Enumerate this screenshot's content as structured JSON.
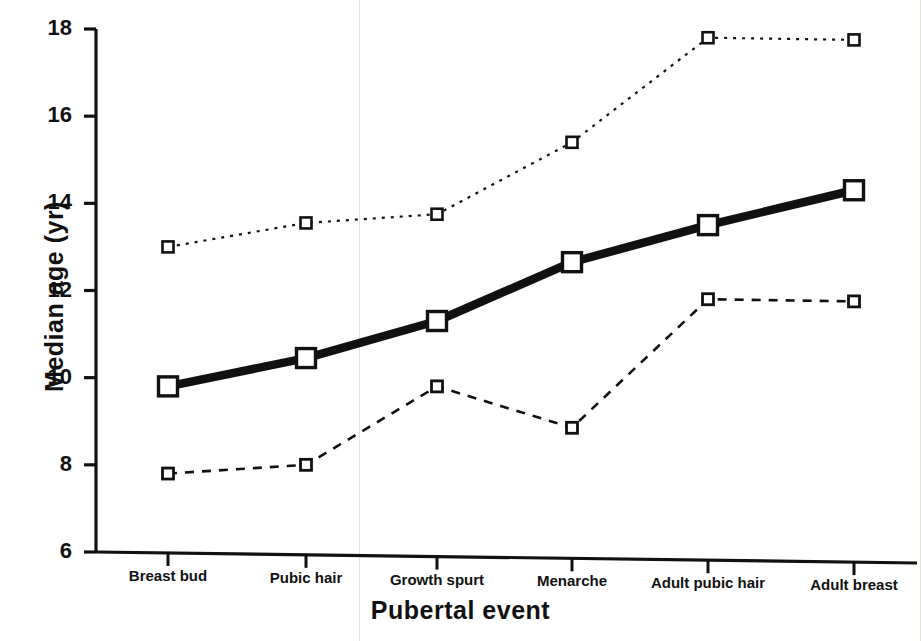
{
  "figure": {
    "background": "#ffffff",
    "ink_color": "#111111",
    "scan_artifact_color": "#dfe2dd"
  },
  "axes": {
    "y_title": "Median age (yr)",
    "x_title": "Pubertal event",
    "y_ticks": [
      "18",
      "16",
      "14",
      "12",
      "10",
      "8",
      "6"
    ],
    "y_tick_values": [
      18,
      16,
      14,
      12,
      10,
      8,
      6
    ]
  },
  "chart_data": {
    "type": "line",
    "title": "",
    "subtitle": "",
    "xlabel": "Pubertal event",
    "ylabel": "Median age (yr)",
    "categories": [
      "Breast bud",
      "Pubic hair",
      "Growth spurt",
      "Menarche",
      "Adult pubic hair",
      "Adult breast"
    ],
    "series": [
      {
        "name": "upper percentile",
        "style": "dotted",
        "marker": "open-square",
        "values": [
          13.0,
          13.55,
          13.75,
          15.4,
          17.8,
          17.75
        ]
      },
      {
        "name": "median",
        "style": "solid-thick",
        "marker": "open-square",
        "values": [
          9.8,
          10.45,
          11.3,
          12.65,
          13.5,
          14.3
        ]
      },
      {
        "name": "lower percentile",
        "style": "dashed",
        "marker": "open-square",
        "values": [
          7.8,
          8.0,
          9.8,
          8.85,
          11.8,
          11.75
        ]
      }
    ],
    "ylim": [
      6,
      18
    ],
    "ytick_step": 2,
    "grid": false,
    "legend": "none",
    "annotations": []
  }
}
